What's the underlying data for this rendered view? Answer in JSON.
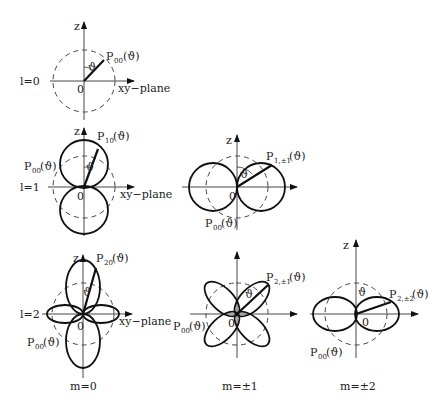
{
  "figure": {
    "type": "spherical-harmonics-polar-diagrams",
    "columns": [
      "m=0",
      "m=±1",
      "m=±2"
    ],
    "rows": [
      "l=0",
      "l=1",
      "l=2"
    ]
  },
  "labels": {
    "z": "z",
    "origin": "0",
    "xy_plane": "xy−plane",
    "theta": "ϑ",
    "P": "P",
    "arg": "(ϑ)",
    "l0": "l=0",
    "l1": "l=1",
    "l2": "l=2",
    "m0": "m=0",
    "m1": "m=±1",
    "m2": "m=±2"
  },
  "panels": [
    {
      "id": "l0m0",
      "function_sub": "00",
      "reference_sub": null
    },
    {
      "id": "l1m0",
      "function_sub": "10",
      "reference_sub": "00"
    },
    {
      "id": "l1m1",
      "function_sub": "1,±1",
      "reference_sub": "00"
    },
    {
      "id": "l2m0",
      "function_sub": "20",
      "reference_sub": "00"
    },
    {
      "id": "l2m1",
      "function_sub": "2,±1",
      "reference_sub": "00"
    },
    {
      "id": "l2m2",
      "function_sub": "2,±2",
      "reference_sub": "00"
    }
  ]
}
